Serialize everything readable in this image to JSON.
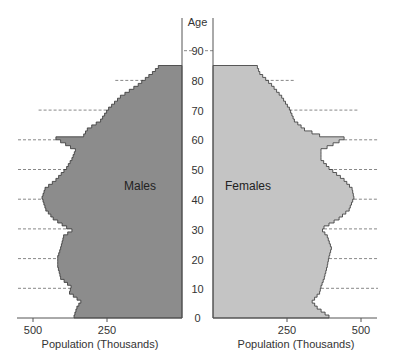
{
  "chart_data": {
    "type": "bar",
    "subtype": "population-pyramid",
    "title": "",
    "ylabel": "Age",
    "xlabel": "Population (Thousands)",
    "age_ticks": [
      0,
      10,
      20,
      30,
      40,
      50,
      60,
      70,
      80,
      90
    ],
    "x_ticks": [
      500,
      250,
      0,
      250,
      500
    ],
    "x_tick_labels_left": [
      "500",
      "250"
    ],
    "x_tick_labels_right": [
      "250",
      "500"
    ],
    "xlim": [
      0,
      530
    ],
    "ylim": [
      0,
      92
    ],
    "grid": "dashed reference lines at each decade outside bars",
    "series": [
      {
        "name": "Males",
        "color": "#8c8c8c",
        "ages": [
          0,
          3,
          5,
          8,
          10,
          13,
          17,
          20,
          23,
          27,
          29,
          30,
          33,
          36,
          40,
          43,
          46,
          50,
          53,
          56,
          59,
          60,
          61,
          63,
          66,
          70,
          74,
          78,
          82,
          84,
          85
        ],
        "values": [
          365,
          355,
          342,
          380,
          375,
          410,
          420,
          420,
          410,
          400,
          372,
          390,
          435,
          460,
          473,
          463,
          426,
          390,
          372,
          360,
          410,
          426,
          332,
          320,
          275,
          248,
          208,
          148,
          100,
          80,
          80
        ]
      },
      {
        "name": "Females",
        "color": "#c4c4c4",
        "ages": [
          0,
          3,
          5,
          8,
          10,
          13,
          17,
          20,
          23,
          27,
          29,
          30,
          33,
          36,
          40,
          43,
          46,
          50,
          53,
          56,
          59,
          60,
          61,
          63,
          66,
          70,
          74,
          78,
          82,
          84,
          85
        ],
        "values": [
          392,
          352,
          335,
          360,
          365,
          376,
          386,
          392,
          400,
          386,
          370,
          375,
          426,
          460,
          476,
          470,
          443,
          392,
          365,
          365,
          426,
          443,
          360,
          309,
          275,
          258,
          232,
          198,
          158,
          150,
          150
        ]
      }
    ],
    "legend": {
      "Males": "left side label",
      "Females": "right side label"
    }
  },
  "labels": {
    "age_axis_title": "Age",
    "males": "Males",
    "females": "Females",
    "x_axis_title_left": "Population (Thousands)",
    "x_axis_title_right": "Population (Thousands)",
    "ticks": {
      "a0": "0",
      "a10": "10",
      "a20": "20",
      "a30": "30",
      "a40": "40",
      "a50": "50",
      "a60": "60",
      "a70": "70",
      "a80": "80",
      "a90": "90",
      "l500": "500",
      "l250": "250",
      "r250": "250",
      "r500": "500"
    }
  }
}
